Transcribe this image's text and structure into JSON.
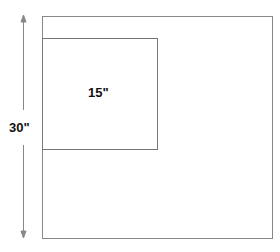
{
  "diagram": {
    "outer_label": "30\"",
    "inner_label": "15\"",
    "line_color": "#777777",
    "arrow_color": "#888888"
  }
}
